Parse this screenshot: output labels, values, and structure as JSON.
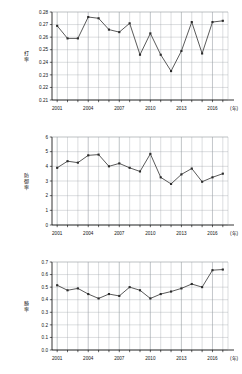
{
  "page": {
    "background_color": "#ffffff",
    "line_color": "#3c3c3c",
    "marker_color": "#2b2b2b",
    "grid_color": "#9aa0a6",
    "axis_color": "#000000"
  },
  "charts": [
    {
      "id": "chart-battingaverage",
      "name": "batting-average-chart",
      "chart_data": {
        "type": "line",
        "title": "",
        "xlabel": "(年)",
        "ylabel": "打率",
        "x": [
          2001,
          2002,
          2003,
          2004,
          2005,
          2006,
          2007,
          2008,
          2009,
          2010,
          2011,
          2012,
          2013,
          2014,
          2015,
          2016,
          2017
        ],
        "values": [
          0.269,
          0.259,
          0.259,
          0.276,
          0.275,
          0.266,
          0.264,
          0.271,
          0.246,
          0.263,
          0.246,
          0.233,
          0.249,
          0.272,
          0.247,
          0.272,
          0.273
        ],
        "xlim": [
          2000.5,
          2017.5
        ],
        "ylim": [
          0.21,
          0.28
        ],
        "yticks": [
          0.21,
          0.22,
          0.23,
          0.24,
          0.25,
          0.26,
          0.27,
          0.28
        ],
        "ytick_labels": [
          "0.21",
          "0.22",
          "0.23",
          "0.24",
          "0.25",
          "0.26",
          "0.27",
          "0.28"
        ],
        "xticks": [
          2001,
          2004,
          2007,
          2010,
          2013,
          2016
        ],
        "xtick_labels": [
          "2001",
          "2004",
          "2007",
          "2010",
          "2013",
          "2016"
        ],
        "grid": true,
        "legend": "none",
        "unit_note": "(年)"
      }
    },
    {
      "id": "chart-era",
      "name": "earned-run-average-chart",
      "chart_data": {
        "type": "line",
        "title": "",
        "xlabel": "(年)",
        "ylabel": "防御率",
        "x": [
          2001,
          2002,
          2003,
          2004,
          2005,
          2006,
          2007,
          2008,
          2009,
          2010,
          2011,
          2012,
          2013,
          2014,
          2015,
          2016,
          2017
        ],
        "values": [
          3.9,
          4.35,
          4.25,
          4.75,
          4.8,
          4.0,
          4.2,
          3.9,
          3.65,
          4.85,
          3.25,
          2.8,
          3.45,
          3.85,
          2.95,
          3.25,
          3.5
        ],
        "xlim": [
          2000.5,
          2017.5
        ],
        "ylim": [
          0,
          6
        ],
        "yticks": [
          0,
          1,
          2,
          3,
          4,
          5,
          6
        ],
        "ytick_labels": [
          "0",
          "1",
          "2",
          "3",
          "4",
          "5",
          "6"
        ],
        "xticks": [
          2001,
          2004,
          2007,
          2010,
          2013,
          2016
        ],
        "xtick_labels": [
          "2001",
          "2004",
          "2007",
          "2010",
          "2013",
          "2016"
        ],
        "grid": true,
        "legend": "none",
        "unit_note": "(年)"
      }
    },
    {
      "id": "chart-winrate",
      "name": "win-rate-chart",
      "chart_data": {
        "type": "line",
        "title": "",
        "xlabel": "(年)",
        "ylabel": "勝率",
        "x": [
          2001,
          2002,
          2003,
          2004,
          2005,
          2006,
          2007,
          2008,
          2009,
          2010,
          2011,
          2012,
          2013,
          2014,
          2015,
          2016,
          2017
        ],
        "values": [
          0.515,
          0.475,
          0.49,
          0.445,
          0.41,
          0.445,
          0.43,
          0.5,
          0.475,
          0.41,
          0.445,
          0.465,
          0.49,
          0.525,
          0.5,
          0.635,
          0.64
        ],
        "xlim": [
          2000.5,
          2017.5
        ],
        "ylim": [
          0.0,
          0.7
        ],
        "yticks": [
          0.0,
          0.1,
          0.2,
          0.3,
          0.4,
          0.5,
          0.6,
          0.7
        ],
        "ytick_labels": [
          "0.0",
          "0.1",
          "0.2",
          "0.3",
          "0.4",
          "0.5",
          "0.6",
          "0.7"
        ],
        "xticks": [
          2001,
          2004,
          2007,
          2010,
          2013,
          2016
        ],
        "xtick_labels": [
          "2001",
          "2004",
          "2007",
          "2010",
          "2013",
          "2016"
        ],
        "grid": true,
        "legend": "none",
        "unit_note": "(年)"
      }
    }
  ]
}
